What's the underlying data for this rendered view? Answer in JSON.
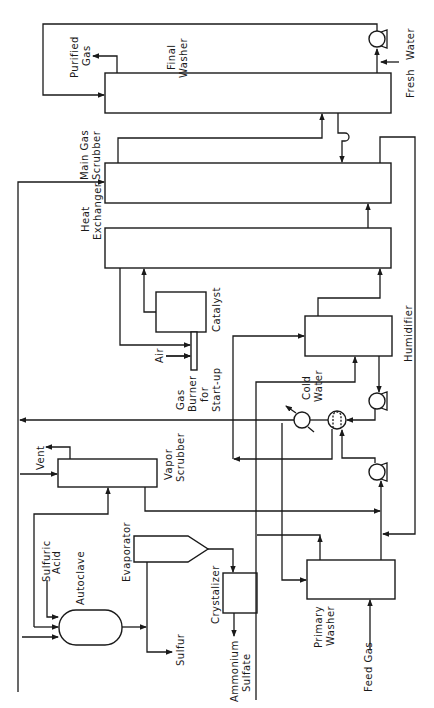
{
  "diagram": {
    "type": "process-flow-diagram",
    "orientation": "rotated-90-ccw",
    "colors": {
      "line": "#1a1a1a",
      "background": "#ffffff"
    },
    "units": [
      {
        "id": "final_washer",
        "label_lines": [
          "Final",
          "Washer"
        ]
      },
      {
        "id": "main_gas_scrubber",
        "label_lines": [
          "Main Gas",
          "Scrubber"
        ]
      },
      {
        "id": "heat_exchanger",
        "label_lines": [
          "Heat",
          "Exchanger"
        ]
      },
      {
        "id": "catalyst",
        "label_lines": [
          "Catalyst"
        ]
      },
      {
        "id": "gas_burner",
        "label_lines": [
          "Gas",
          "Burner",
          "for",
          "Start-up"
        ]
      },
      {
        "id": "humidifier",
        "label_lines": [
          "Humidifier"
        ]
      },
      {
        "id": "vapor_scrubber",
        "label_lines": [
          "Vapor",
          "Scrubber"
        ]
      },
      {
        "id": "primary_washer",
        "label_lines": [
          "Primary",
          "Washer"
        ]
      },
      {
        "id": "evaporator",
        "label_lines": [
          "Evaporator"
        ]
      },
      {
        "id": "crystalizer",
        "label_lines": [
          "Crystalizer"
        ]
      },
      {
        "id": "autoclave",
        "label_lines": [
          "Autoclave"
        ]
      }
    ],
    "streams": [
      {
        "id": "purified_gas",
        "label_lines": [
          "Purified",
          "Gas"
        ]
      },
      {
        "id": "fresh_water",
        "label_lines": [
          "Fresh",
          "Water"
        ]
      },
      {
        "id": "air",
        "label_lines": [
          "Air"
        ]
      },
      {
        "id": "cold_water",
        "label_lines": [
          "Cold",
          "Water"
        ]
      },
      {
        "id": "vent",
        "label_lines": [
          "Vent"
        ]
      },
      {
        "id": "sulfuric_acid",
        "label_lines": [
          "Sulfuric",
          "Acid"
        ]
      },
      {
        "id": "sulfur",
        "label_lines": [
          "Sulfur"
        ]
      },
      {
        "id": "ammonium_sulfate",
        "label_lines": [
          "Ammonium",
          "Sulfate"
        ]
      },
      {
        "id": "feed_gas",
        "label_lines": [
          "Feed Gas"
        ]
      }
    ],
    "labels": {
      "final_washer_1": "Final",
      "final_washer_2": "Washer",
      "main_gas_scrubber_1": "Main Gas",
      "main_gas_scrubber_2": "Scrubber",
      "heat_exchanger_1": "Heat",
      "heat_exchanger_2": "Exchanger",
      "catalyst": "Catalyst",
      "gas_burner_1": "Gas",
      "gas_burner_2": "Burner",
      "gas_burner_3": "for",
      "gas_burner_4": "Start-up",
      "humidifier": "Humidifier",
      "vapor_scrubber_1": "Vapor",
      "vapor_scrubber_2": "Scrubber",
      "primary_washer_1": "Primary",
      "primary_washer_2": "Washer",
      "evaporator": "Evaporator",
      "crystalizer": "Crystalizer",
      "autoclave": "Autoclave",
      "purified_gas_1": "Purified",
      "purified_gas_2": "Gas",
      "fresh_water_1": "Fresh",
      "fresh_water_2": "Water",
      "air": "Air",
      "cold_water_1": "Cold",
      "cold_water_2": "Water",
      "vent": "Vent",
      "sulfuric_acid_1": "Sulfuric",
      "sulfuric_acid_2": "Acid",
      "sulfur": "Sulfur",
      "ammonium_sulfate_1": "Ammonium",
      "ammonium_sulfate_2": "Sulfate",
      "feed_gas": "Feed Gas"
    }
  }
}
